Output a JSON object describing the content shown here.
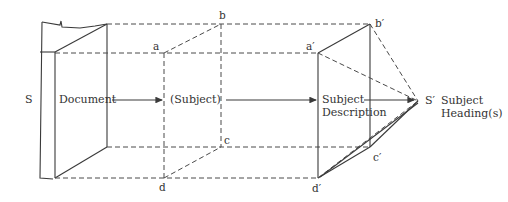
{
  "diagram": {
    "labels": {
      "source": "S",
      "document": "Document",
      "subject": "(Subject)",
      "subject_description_line1": "Subject",
      "subject_description_line2": "Description",
      "target": "S′",
      "subject_headings_line1": "Subject",
      "subject_headings_line2": "Heading(s)"
    },
    "points": {
      "a": "a",
      "b": "b",
      "c": "c",
      "d": "d",
      "a_prime": "a′",
      "b_prime": "b′",
      "c_prime": "c′",
      "d_prime": "d′"
    },
    "colors": {
      "line": "#3a3a3a",
      "text": "#333333",
      "background": "#ffffff"
    }
  }
}
